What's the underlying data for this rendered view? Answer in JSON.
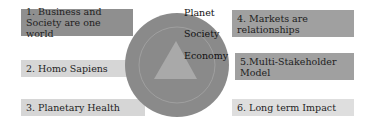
{
  "left_boxes": [
    {
      "label": "1. Business and Society are one world"
    },
    {
      "label": "2. Homo Sapiens"
    },
    {
      "label": "3. Planetary Health"
    }
  ],
  "right_boxes": [
    {
      "label": "4. Markets are relationships"
    },
    {
      "label": "5.Multi-Stakeholder Model"
    },
    {
      "label": "6. Long term Impact"
    }
  ],
  "center": {
    "labels": [
      "Planet",
      "Society",
      "Economy"
    ]
  },
  "colors": {
    "circle": "#8a8a8a",
    "inner_ring": "#a4a4a4",
    "triangle": "#a9a9a9"
  }
}
